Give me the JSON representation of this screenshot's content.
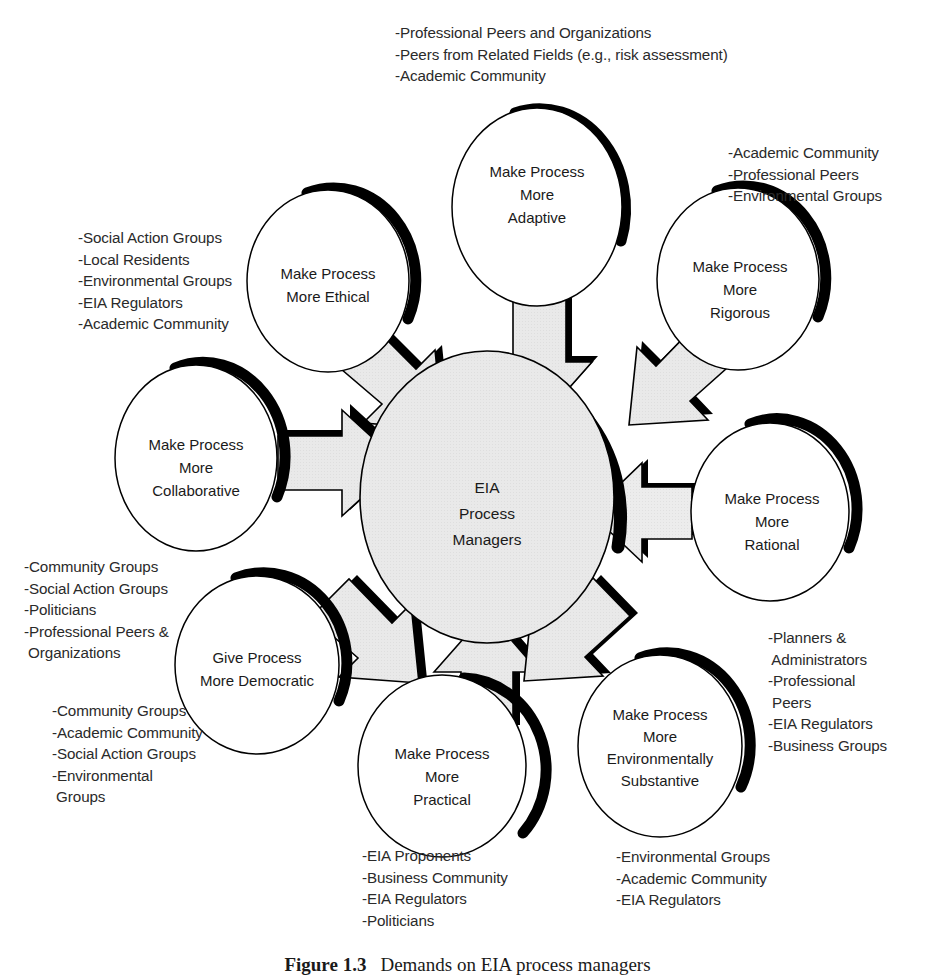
{
  "figure": {
    "caption_label": "Figure 1.3",
    "caption_text": "Demands on EIA process managers"
  },
  "center": {
    "name": "EIA Process Managers",
    "lines": [
      "EIA",
      "Process",
      "Managers"
    ],
    "fill": "#e8e8e8",
    "shadow": "#000000"
  },
  "nodes": [
    {
      "id": "adaptive",
      "lines": [
        "Make Process",
        "More",
        "Adaptive"
      ],
      "cx": 537,
      "cy": 207,
      "rx": 86,
      "ry": 100
    },
    {
      "id": "ethical",
      "lines": [
        "Make Process",
        "More Ethical"
      ],
      "cx": 328,
      "cy": 281,
      "rx": 82,
      "ry": 92
    },
    {
      "id": "rigorous",
      "lines": [
        "Make Process",
        "More",
        "Rigorous"
      ],
      "cx": 738,
      "cy": 279,
      "rx": 82,
      "ry": 92
    },
    {
      "id": "collaborative",
      "lines": [
        "Make Process",
        "More",
        "Collaborative"
      ],
      "cx": 196,
      "cy": 458,
      "rx": 82,
      "ry": 94
    },
    {
      "id": "rational",
      "lines": [
        "Make Process",
        "More",
        "Rational"
      ],
      "cx": 770,
      "cy": 512,
      "rx": 80,
      "ry": 90
    },
    {
      "id": "democratic",
      "lines": [
        "Give Process",
        "More Democratic"
      ],
      "cx": 257,
      "cy": 665,
      "rx": 83,
      "ry": 90
    },
    {
      "id": "practical",
      "lines": [
        "Make Process",
        "More",
        "Practical"
      ],
      "cx": 442,
      "cy": 766,
      "rx": 85,
      "ry": 92
    },
    {
      "id": "environmentally-substantive",
      "lines": [
        "Make Process",
        "More",
        "Environmentally",
        "Substantive"
      ],
      "cx": 660,
      "cy": 746,
      "rx": 83,
      "ry": 92
    }
  ],
  "annotations": [
    {
      "id": "adaptive-stakeholders",
      "for": "adaptive",
      "x": 395,
      "y": 22,
      "lines": [
        "-Professional Peers and Organizations",
        "-Peers from Related Fields (e.g., risk assessment)",
        "-Academic Community"
      ]
    },
    {
      "id": "rigorous-stakeholders",
      "for": "rigorous",
      "x": 728,
      "y": 142,
      "lines": [
        "-Academic Community",
        "-Professional Peers",
        "-Environmental Groups"
      ]
    },
    {
      "id": "ethical-stakeholders",
      "for": "ethical",
      "x": 78,
      "y": 227,
      "lines": [
        "-Social Action Groups",
        "-Local Residents",
        "-Environmental Groups",
        "-EIA Regulators",
        "-Academic Community"
      ]
    },
    {
      "id": "collaborative-stakeholders",
      "for": "collaborative",
      "x": 24,
      "y": 556,
      "lines": [
        "-Community Groups",
        "-Social Action Groups",
        "-Politicians",
        "-Professional Peers &",
        " Organizations"
      ]
    },
    {
      "id": "democratic-stakeholders",
      "for": "democratic",
      "x": 52,
      "y": 700,
      "lines": [
        "-Community Groups",
        "-Academic Community",
        "-Social Action Groups",
        "-Environmental",
        " Groups"
      ]
    },
    {
      "id": "rational-stakeholders",
      "for": "rational",
      "x": 768,
      "y": 627,
      "lines": [
        "-Planners &",
        " Administrators",
        "-Professional",
        " Peers",
        "-EIA Regulators",
        "-Business Groups"
      ]
    },
    {
      "id": "practical-stakeholders",
      "for": "practical",
      "x": 362,
      "y": 845,
      "lines": [
        "-EIA Proponents",
        "-Business Community",
        "-EIA Regulators",
        "-Politicians"
      ]
    },
    {
      "id": "environmentally-substantive-stakeholders",
      "for": "environmentally-substantive",
      "x": 616,
      "y": 846,
      "lines": [
        "-Environmental Groups",
        "-Academic Community",
        "-EIA Regulators"
      ]
    }
  ],
  "arrows": [
    {
      "id": "arrow-adaptive-to-center",
      "from": "adaptive",
      "to": "center"
    },
    {
      "id": "arrow-ethical-to-center",
      "from": "ethical",
      "to": "center"
    },
    {
      "id": "arrow-rigorous-to-center",
      "from": "rigorous",
      "to": "center"
    },
    {
      "id": "arrow-collaborative-to-center",
      "from": "collaborative",
      "to": "center"
    },
    {
      "id": "arrow-rational-to-center",
      "from": "rational",
      "to": "center"
    },
    {
      "id": "arrow-democratic-to-center",
      "from": "democratic",
      "to": "center"
    },
    {
      "id": "arrow-practical-to-center",
      "from": "practical",
      "to": "center"
    },
    {
      "id": "arrow-environmental-to-center",
      "from": "environmentally-substantive",
      "to": "center"
    }
  ],
  "style": {
    "arrow_fill": "#e6e6e6",
    "arrow_stroke": "#000000",
    "node_fill": "#ffffff",
    "node_stroke": "#000000"
  }
}
